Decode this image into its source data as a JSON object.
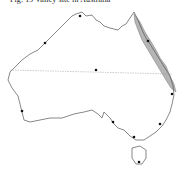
{
  "title": "Fig. 19 Valley site in Australia",
  "map": {
    "region": "Australia",
    "features": {
      "tropic_line": "Tropic of Capricorn (dotted)",
      "shaded_region": "Great Barrier Reef"
    },
    "colors": {
      "coast": "#555555",
      "reef_fill": "#b5b5b5",
      "tropic_line": "#999999",
      "city_dot": "#111111"
    },
    "points": [
      {
        "name": "darwin",
        "x": 80,
        "y": 16
      },
      {
        "name": "broome",
        "x": 45,
        "y": 43
      },
      {
        "name": "cairns",
        "x": 148,
        "y": 41
      },
      {
        "name": "alice-springs",
        "x": 96,
        "y": 70
      },
      {
        "name": "brisbane",
        "x": 172,
        "y": 94
      },
      {
        "name": "perth",
        "x": 22,
        "y": 111
      },
      {
        "name": "adelaide",
        "x": 113,
        "y": 122
      },
      {
        "name": "sydney",
        "x": 160,
        "y": 124
      },
      {
        "name": "melbourne",
        "x": 134,
        "y": 137
      },
      {
        "name": "hobart",
        "x": 139,
        "y": 162
      }
    ]
  }
}
